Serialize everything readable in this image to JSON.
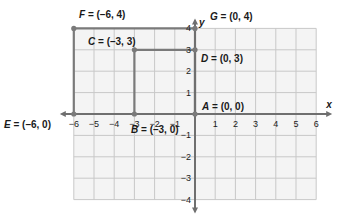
{
  "diagram": {
    "type": "coordinate-plane",
    "x_axis_label": "x",
    "y_axis_label": "y",
    "x_range": [
      -6,
      6
    ],
    "y_range": [
      -4,
      4
    ],
    "x_ticks": [
      "-6",
      "-5",
      "-4",
      "-3",
      "-2",
      "-1",
      "1",
      "2",
      "3",
      "4",
      "5",
      "6"
    ],
    "y_ticks": [
      "4",
      "3",
      "2",
      "1",
      "-1",
      "-2",
      "-3",
      "-4"
    ],
    "points": [
      {
        "name": "A",
        "label": "A = (0, 0)",
        "x": 0,
        "y": 0
      },
      {
        "name": "B",
        "label": "B = (-3, 0)",
        "x": -3,
        "y": 0
      },
      {
        "name": "C",
        "label": "C = (-3, 3)",
        "x": -3,
        "y": 3
      },
      {
        "name": "D",
        "label": "D = (0, 3)",
        "x": 0,
        "y": 3
      },
      {
        "name": "E",
        "label": "E = (-6, 0)",
        "x": -6,
        "y": 0
      },
      {
        "name": "F",
        "label": "F = (-6, 4)",
        "x": -6,
        "y": 4
      },
      {
        "name": "G",
        "label": "G = (0, 4)",
        "x": 0,
        "y": 4
      }
    ],
    "rectangles": [
      {
        "name": "EFGA",
        "vertices": [
          "E",
          "F",
          "G",
          "A"
        ]
      },
      {
        "name": "BCDA",
        "vertices": [
          "B",
          "C",
          "D",
          "A"
        ]
      }
    ],
    "colors": {
      "grid": "#c8c8c8",
      "grid_bg": "#f4f4f4",
      "axis": "#6f6f6f",
      "shape": "#7a7a7a",
      "text": "#1a1a1a"
    }
  }
}
